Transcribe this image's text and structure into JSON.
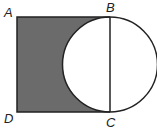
{
  "diagram": {
    "labels": {
      "A": "A",
      "B": "B",
      "C": "C",
      "D": "D"
    },
    "colors": {
      "shade": "#6b6b6b",
      "stroke": "#222222",
      "background": "#ffffff"
    }
  }
}
